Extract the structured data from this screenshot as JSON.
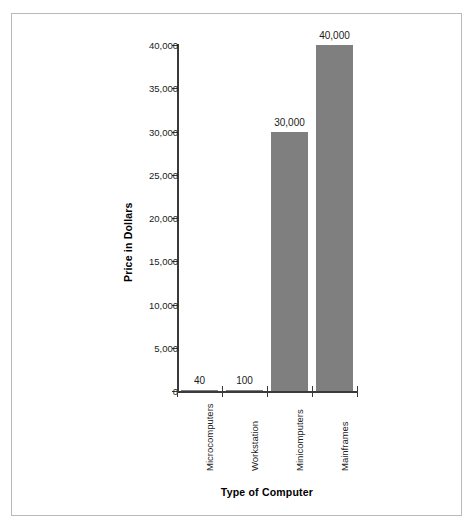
{
  "chart_data": {
    "type": "bar",
    "title": "",
    "xlabel": "Type of Computer",
    "ylabel": "Price in Dollars",
    "categories": [
      "Microcomputers",
      "Workstation",
      "Minicomputers",
      "Mainframes"
    ],
    "values": [
      40,
      100,
      30000,
      40000
    ],
    "value_labels": [
      "40",
      "100",
      "30,000",
      "40,000"
    ],
    "ylim": [
      0,
      40000
    ],
    "ytick_values": [
      0,
      5000,
      10000,
      15000,
      20000,
      25000,
      30000,
      35000,
      40000
    ],
    "ytick_labels": [
      "0",
      "5,000",
      "10,000",
      "15,000",
      "20,000",
      "25,000",
      "30,000",
      "35,000",
      "40,000"
    ],
    "grid": false,
    "legend": null,
    "bar_color": "#7f7f7f",
    "axis_color": "#3a3a3a",
    "frame_color": "#b9b9b9",
    "background": "#ffffff"
  },
  "axis": {
    "y_title": "Price in Dollars",
    "x_title": "Type of Computer"
  }
}
